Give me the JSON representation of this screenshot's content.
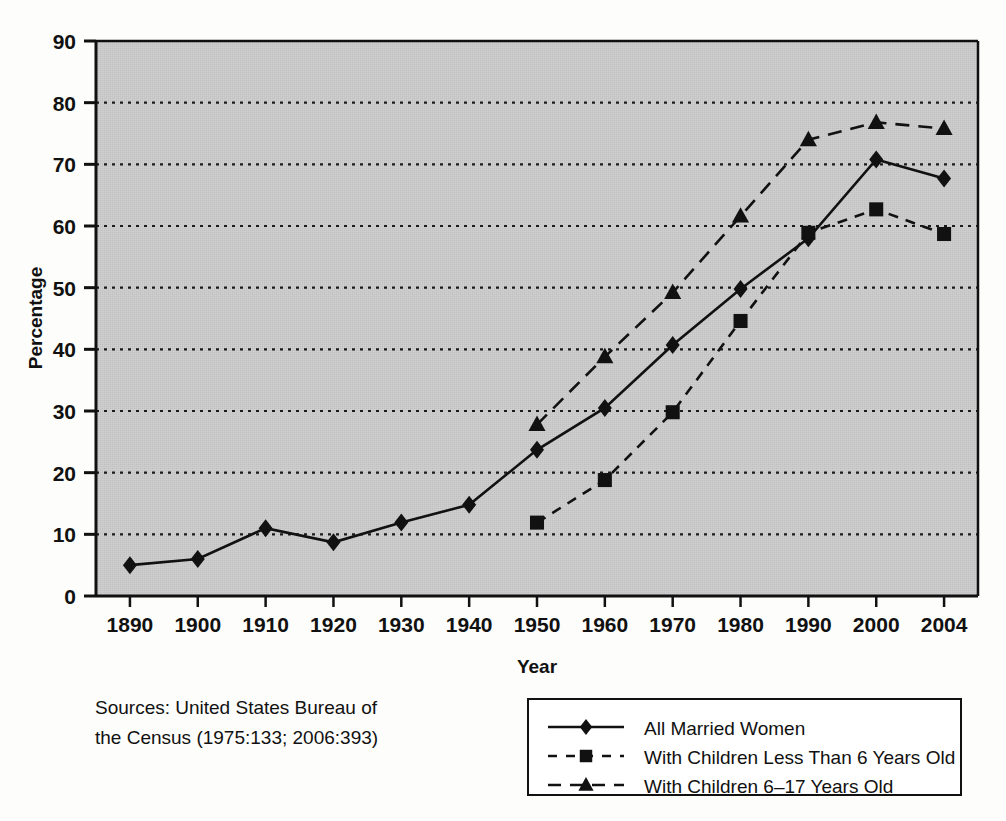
{
  "chart_data": {
    "type": "line",
    "title": "",
    "xlabel": "Year",
    "ylabel": "Percentage",
    "categories": [
      "1890",
      "1900",
      "1910",
      "1920",
      "1930",
      "1940",
      "1950",
      "1960",
      "1970",
      "1980",
      "1990",
      "2000",
      "2004"
    ],
    "x_tick_labels": [
      "1890",
      "1900",
      "1910",
      "1920",
      "1930",
      "1940",
      "1950",
      "1960",
      "1970",
      "1980",
      "1990",
      "2000",
      "2004"
    ],
    "y_tick_labels": [
      "0",
      "10",
      "20",
      "30",
      "40",
      "50",
      "60",
      "70",
      "80",
      "90"
    ],
    "ylim": [
      0,
      90
    ],
    "y_ticks": [
      0,
      10,
      20,
      30,
      40,
      50,
      60,
      70,
      80,
      90
    ],
    "grid": "horizontal-dotted",
    "legend_position": "below-right",
    "plot_background": "#c9c9c9",
    "line_color": "#111111",
    "series": [
      {
        "name": "All Married Women",
        "marker": "diamond",
        "line_style": "solid",
        "values": [
          5.0,
          6.0,
          11.0,
          8.7,
          11.9,
          14.8,
          23.7,
          30.5,
          40.7,
          49.8,
          58.0,
          70.8,
          67.7
        ]
      },
      {
        "name": "With Children Less Than 6 Years Old",
        "marker": "square",
        "line_style": "dashed",
        "values": [
          null,
          null,
          null,
          null,
          null,
          null,
          11.9,
          18.8,
          29.8,
          44.6,
          58.9,
          62.7,
          58.7
        ]
      },
      {
        "name": "With Children 6–17 Years Old",
        "marker": "triangle",
        "line_style": "dashed",
        "values": [
          null,
          null,
          null,
          null,
          null,
          null,
          27.8,
          38.8,
          49.2,
          61.6,
          74.0,
          76.8,
          75.8
        ]
      }
    ]
  },
  "legend": {
    "items": [
      {
        "label": "All Married Women",
        "marker": "diamond",
        "line_style": "solid"
      },
      {
        "label": "With Children Less Than 6 Years Old",
        "marker": "square",
        "line_style": "dashed"
      },
      {
        "label": "With Children 6–17 Years Old",
        "marker": "triangle",
        "line_style": "dashed"
      }
    ]
  },
  "source_note": {
    "line1": "Sources: United States Bureau of",
    "line2": "the Census (1975:133; 2006:393)"
  }
}
